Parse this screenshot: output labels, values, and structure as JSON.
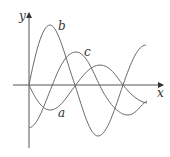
{
  "diagram": {
    "type": "function-graphs",
    "axes": {
      "x_label": "x",
      "y_label": "y",
      "color": "#555555"
    },
    "curves": [
      {
        "label": "a",
        "description": "starts at origin, dips to a trough, rises to a smaller peak, then descends"
      },
      {
        "label": "b",
        "description": "starts at origin, rises to tallest peak, falls to deepest trough, then rises"
      },
      {
        "label": "c",
        "description": "starts below origin, rises to a peak, falls to a trough, then rises slightly"
      }
    ],
    "curve_color": "#6b6b6b"
  }
}
